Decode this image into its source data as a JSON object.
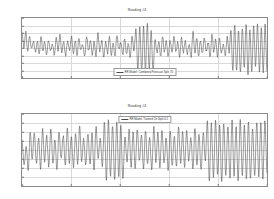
{
  "figure": {
    "background": "#ffffff",
    "trace_color": "#4a4a4a",
    "grid_color": "#d9d9d9",
    "axis_color": "#8a8a8a"
  },
  "chart_data": [
    {
      "type": "line",
      "id": "top",
      "title": "Reading #4",
      "xlabel": "",
      "ylabel": "",
      "xlim": [
        0,
        5000
      ],
      "ylim": [
        -4,
        4
      ],
      "grid": true,
      "legend_position": "bottom-center",
      "legend": [
        "RR Model: Combined Forecast Split 70"
      ],
      "xticks": [
        0,
        1000,
        2000,
        3000,
        4000,
        5000
      ],
      "xtick_labels": [
        "0",
        "1000",
        "2000",
        "3000",
        "4000",
        "5000"
      ],
      "yticks": [
        -4,
        -3,
        -2,
        -1,
        0,
        1,
        2,
        3,
        4
      ],
      "ytick_labels": [
        "-4",
        "-3",
        "-2",
        "-1",
        "0",
        "1",
        "2",
        "3",
        "4"
      ],
      "series": [
        {
          "name": "RR Model: Combined Forecast Split 70",
          "values": [
            1.9,
            0.2,
            2.1,
            -0.4,
            1.6,
            -0.2,
            1.0,
            -0.6,
            0.9,
            -0.8,
            1.4,
            -0.3,
            0.7,
            -0.9,
            1.1,
            -0.5,
            0.6,
            -1.0,
            1.3,
            -0.2,
            1.7,
            -0.5,
            0.8,
            -1.1,
            1.0,
            -0.4,
            1.5,
            -0.6,
            0.9,
            -0.9,
            1.2,
            -0.3,
            0.5,
            -1.2,
            1.6,
            -0.4,
            1.0,
            -0.8,
            0.7,
            -1.0,
            2.0,
            -0.5,
            1.1,
            -1.3,
            0.8,
            -0.6,
            1.4,
            -0.9,
            0.6,
            -1.1,
            1.8,
            -0.3,
            0.9,
            -1.0,
            1.2,
            -0.7,
            0.5,
            -1.2,
            1.5,
            -0.4,
            2.6,
            -3.2,
            2.9,
            -3.4,
            2.7,
            -3.0,
            3.1,
            -2.8,
            2.4,
            -3.3,
            1.2,
            -0.6,
            0.8,
            -1.0,
            1.4,
            -0.5,
            0.9,
            -1.2,
            1.1,
            -0.7,
            1.6,
            -0.4,
            0.7,
            -1.1,
            1.3,
            -0.6,
            1.0,
            -0.9,
            0.6,
            -1.3,
            2.1,
            -0.5,
            1.2,
            -1.0,
            0.9,
            -0.8,
            1.5,
            -0.6,
            0.8,
            -1.2,
            1.7,
            -0.4,
            1.0,
            -1.1,
            1.3,
            -0.7,
            0.6,
            -1.0,
            1.4,
            -0.5,
            2.2,
            -2.9,
            3.0,
            -3.1,
            2.5,
            -3.4,
            2.8,
            -2.7,
            3.2,
            -3.5,
            2.3,
            -3.0,
            2.9,
            -2.6,
            3.3,
            -3.2,
            2.6,
            -3.1,
            3.0,
            -2.9
          ]
        }
      ]
    },
    {
      "type": "line",
      "id": "bottom",
      "title": "Reading #4",
      "xlabel": "",
      "ylabel": "",
      "xlim": [
        0,
        5000
      ],
      "ylim": [
        -4,
        4
      ],
      "grid": true,
      "legend_position": "top-center",
      "legend": [
        "RR Model: Trained On Split 0.5"
      ],
      "xticks": [
        0,
        1000,
        2000,
        3000,
        4000,
        5000
      ],
      "xtick_labels": [
        "0",
        "1000",
        "2000",
        "3000",
        "4000",
        "5000"
      ],
      "yticks": [
        -4,
        -3,
        -2,
        -1,
        0,
        1,
        2,
        3,
        4
      ],
      "ytick_labels": [
        "-4",
        "-3",
        "-2",
        "-1",
        "0",
        "1",
        "2",
        "3",
        "4"
      ],
      "series": [
        {
          "name": "RR Model: Trained On Split 0.5",
          "values": [
            1.2,
            -1.8,
            0.4,
            -2.2,
            1.8,
            -1.0,
            2.0,
            -1.6,
            1.4,
            -2.0,
            2.2,
            -1.2,
            1.6,
            -1.9,
            2.4,
            -1.4,
            1.0,
            -2.1,
            2.1,
            -1.1,
            1.7,
            -1.7,
            2.3,
            -1.3,
            1.5,
            -2.0,
            1.9,
            -1.5,
            2.5,
            -1.2,
            1.3,
            -1.8,
            2.0,
            -1.6,
            1.8,
            -2.2,
            2.6,
            -1.0,
            1.4,
            -1.9,
            3.0,
            -3.2,
            3.2,
            -3.0,
            2.8,
            -3.4,
            3.1,
            -2.9,
            2.7,
            -3.3,
            1.6,
            -1.4,
            2.2,
            -1.8,
            1.9,
            -2.1,
            2.4,
            -1.3,
            1.7,
            -2.0,
            2.1,
            -1.6,
            1.5,
            -2.3,
            2.5,
            -1.2,
            1.8,
            -1.9,
            2.3,
            -1.5,
            1.4,
            -2.2,
            2.0,
            -1.7,
            1.6,
            -2.0,
            2.6,
            -1.4,
            1.9,
            -1.8,
            2.2,
            -1.3,
            1.5,
            -2.1,
            2.4,
            -1.6,
            1.8,
            -2.4,
            2.0,
            -1.2,
            3.1,
            -3.3,
            2.9,
            -3.1,
            3.3,
            -2.8,
            2.6,
            -3.5,
            3.0,
            -3.0,
            2.8,
            -3.2,
            3.2,
            -2.7,
            2.5,
            -3.4,
            3.4,
            -2.9,
            2.7,
            -3.1,
            3.0,
            -3.3,
            2.6,
            -3.0,
            3.1,
            -2.8,
            2.9,
            -3.2,
            3.3,
            -2.6
          ]
        }
      ]
    }
  ]
}
